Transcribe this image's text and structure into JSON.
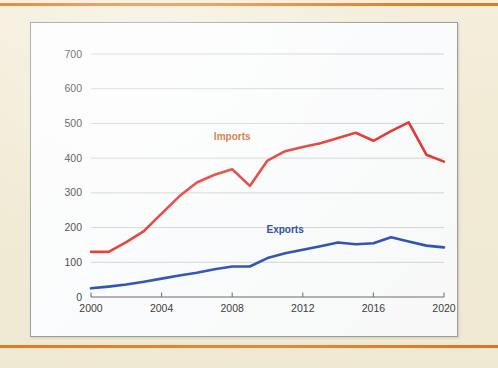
{
  "page": {
    "background_color": "#f2ecd7",
    "rule_color": "#e07a22",
    "panel_background": "#fdfdfd",
    "panel_border_color": "#9d9d9d"
  },
  "chart_data": {
    "type": "line",
    "title": "",
    "subtitle": "",
    "xlabel": "",
    "ylabel": "",
    "xlim": [
      2000,
      2020
    ],
    "ylim": [
      0,
      700
    ],
    "grid": "horizontal",
    "legend_position": "inline-annotation",
    "y_ticks": [
      0,
      100,
      200,
      300,
      400,
      500,
      600,
      700
    ],
    "y_tick_labels": [
      "0",
      "100",
      "200",
      "300",
      "400",
      "500",
      "600",
      "700"
    ],
    "x_ticks": [
      2000,
      2004,
      2008,
      2012,
      2016,
      2020
    ],
    "x_tick_labels": [
      "2000",
      "2004",
      "2008",
      "2012",
      "2016",
      "2020"
    ],
    "x": [
      2000,
      2001,
      2002,
      2003,
      2004,
      2005,
      2006,
      2007,
      2008,
      2009,
      2010,
      2011,
      2012,
      2013,
      2014,
      2015,
      2016,
      2017,
      2018,
      2019,
      2020
    ],
    "series": [
      {
        "name": "Imports",
        "color": "#e03a32",
        "label_color": "#c96a2a",
        "label_x": 2008,
        "label_y": 452,
        "values": [
          130,
          130,
          158,
          190,
          240,
          290,
          330,
          352,
          368,
          320,
          393,
          420,
          432,
          443,
          458,
          473,
          450,
          478,
          503,
          410,
          390
        ]
      },
      {
        "name": "Exports",
        "color": "#2f55b0",
        "label_color": "#2a4a9e",
        "label_x": 2011,
        "label_y": 185,
        "values": [
          25,
          30,
          36,
          44,
          53,
          62,
          70,
          80,
          88,
          88,
          112,
          126,
          136,
          146,
          157,
          152,
          155,
          172,
          160,
          148,
          143
        ]
      }
    ]
  }
}
